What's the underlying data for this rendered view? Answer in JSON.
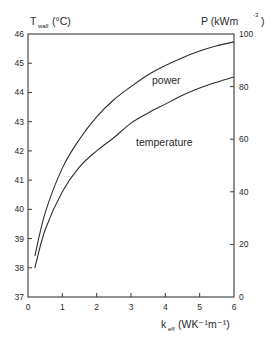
{
  "chart_data": {
    "type": "line",
    "title": "",
    "xlabel": "k_eff (WK⁻¹m⁻¹)",
    "ylabel_left": "T_wall (°C)",
    "ylabel_right": "P (kWm⁻³)",
    "xlim": [
      0,
      6
    ],
    "ylim_left": [
      37,
      46
    ],
    "ylim_right": [
      0,
      100
    ],
    "x_ticks": [
      "0",
      "1",
      "2",
      "3",
      "4",
      "5",
      "6"
    ],
    "y_ticks_left": [
      "37",
      "38",
      "39",
      "40",
      "41",
      "42",
      "43",
      "44",
      "45",
      "46"
    ],
    "y_ticks_right": [
      "0",
      "20",
      "40",
      "60",
      "80",
      "100"
    ],
    "grid": false,
    "legend": "inline labels",
    "series": [
      {
        "name": "power",
        "axis": "right",
        "x": [
          0.2,
          0.5,
          1.0,
          1.5,
          2.0,
          2.5,
          3.0,
          3.5,
          4.0,
          4.5,
          5.0,
          5.5,
          6.0
        ],
        "values": [
          15.6,
          32,
          49,
          60,
          68.5,
          75,
          80,
          84.5,
          88,
          91,
          93.5,
          95.5,
          97
        ]
      },
      {
        "name": "temperature",
        "axis": "left",
        "x": [
          0.2,
          0.5,
          1.0,
          1.5,
          2.0,
          2.5,
          3.0,
          3.5,
          4.0,
          4.5,
          5.0,
          5.5,
          6.0
        ],
        "values": [
          38.0,
          39.3,
          40.6,
          41.45,
          42.0,
          42.45,
          42.95,
          43.3,
          43.6,
          43.9,
          44.15,
          44.35,
          44.53
        ]
      }
    ]
  },
  "labels": {
    "left_axis_title_main": "T",
    "left_axis_title_sub": "wall",
    "left_axis_title_unit": "(°C)",
    "right_axis_title": "P  (kWm",
    "right_axis_title_exp": "-3",
    "right_axis_title_close": ")",
    "x_axis_title_main": "k",
    "x_axis_title_sub": "eff",
    "x_axis_title_unit": "(WK⁻¹m⁻¹)",
    "series_power": "power",
    "series_temperature": "temperature"
  }
}
